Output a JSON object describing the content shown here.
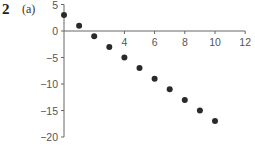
{
  "figure": {
    "number": "2",
    "part": "(a)"
  },
  "chart_data": {
    "type": "scatter",
    "title": "",
    "xlabel": "",
    "ylabel": "",
    "xlim": [
      0,
      12
    ],
    "ylim": [
      -20,
      5
    ],
    "x_ticks": [
      4,
      6,
      8,
      10,
      12
    ],
    "y_ticks": [
      5,
      0,
      -5,
      -10,
      -15,
      -20
    ],
    "x_tick_labels": [
      "4",
      "6",
      "8",
      "10",
      "12"
    ],
    "y_tick_labels": [
      "5",
      "0",
      "−5",
      "−10",
      "−15",
      "−20"
    ],
    "grid": false,
    "legend": null,
    "series": [
      {
        "name": "points",
        "color": "#2a2a2a",
        "x": [
          0,
          1,
          2,
          3,
          4,
          5,
          6,
          7,
          8,
          9,
          10
        ],
        "y": [
          3,
          1,
          -1,
          -3,
          -5,
          -7,
          -9,
          -11,
          -13,
          -15,
          -17
        ]
      }
    ]
  },
  "colors": {
    "axis": "#666666",
    "point": "#2a2a2a",
    "text": "#555555"
  }
}
